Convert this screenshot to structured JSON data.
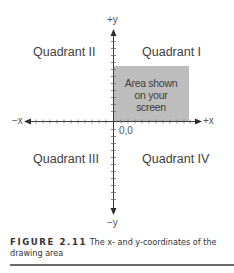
{
  "diagram": {
    "quadrants": {
      "q1": "Quadrant I",
      "q2": "Quadrant II",
      "q3": "Quadrant III",
      "q4": "Quadrant IV"
    },
    "axes": {
      "pos_y": "+y",
      "neg_y": "−y",
      "pos_x": "+x",
      "neg_x": "−x",
      "origin": "0,0"
    },
    "screen_area": {
      "line1": "Area shown",
      "line2": "on your",
      "line3": "screen",
      "color": "#bdbdbd"
    },
    "colors": {
      "axis": "#3a3a3a",
      "screen_fill": "#bdbdbd",
      "text": "#404040"
    }
  },
  "caption": {
    "figure_label": "FIGURE 2.11",
    "text": "The x- and y-coordinates of the drawing area"
  }
}
